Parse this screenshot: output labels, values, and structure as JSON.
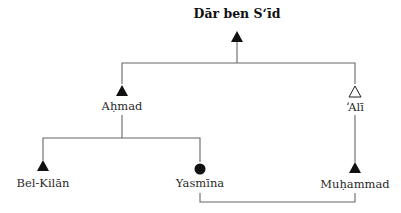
{
  "diagram": {
    "type": "kinship-chart",
    "colors": {
      "line": "#555555",
      "symbol": "#111111",
      "background": "#ffffff"
    },
    "nodes": [
      {
        "id": "dar",
        "label": "Dār ben S‘īd",
        "sex": "male",
        "symbol": "filled-triangle",
        "role": "lineage-founder"
      },
      {
        "id": "ahmad",
        "label": "Aḥmad",
        "sex": "male",
        "symbol": "filled-triangle"
      },
      {
        "id": "ali",
        "label": "‘Alī",
        "sex": "male",
        "symbol": "hollow-triangle"
      },
      {
        "id": "belkilan",
        "label": "Bel-Kilān",
        "sex": "male",
        "symbol": "filled-triangle"
      },
      {
        "id": "yasmina",
        "label": "Yasmīna",
        "sex": "female",
        "symbol": "filled-circle"
      },
      {
        "id": "muhammad",
        "label": "Muḥammad",
        "sex": "male",
        "symbol": "filled-triangle"
      }
    ],
    "edges": [
      {
        "from": "dar",
        "to": "ahmad",
        "type": "descent"
      },
      {
        "from": "dar",
        "to": "ali",
        "type": "descent"
      },
      {
        "from": "ahmad",
        "to": "belkilan",
        "type": "descent"
      },
      {
        "from": "ahmad",
        "to": "yasmina",
        "type": "descent"
      },
      {
        "from": "ali",
        "to": "muhammad",
        "type": "descent"
      },
      {
        "from": "yasmina",
        "to": "muhammad",
        "type": "marriage"
      }
    ]
  },
  "labels": {
    "title": "Dār ben S‘īd",
    "ahmad": "Aḥmad",
    "ali": "‘Alī",
    "belkilan": "Bel-Kilān",
    "yasmina": "Yasmīna",
    "muhammad": "Muḥammad"
  }
}
